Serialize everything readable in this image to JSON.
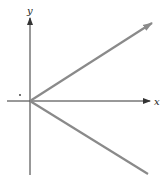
{
  "diagram": {
    "type": "coordinate-axes-with-rays",
    "axes": {
      "x_label": "x",
      "y_label": "y"
    },
    "origin": {
      "px": 30,
      "py": 101
    },
    "rays": [
      {
        "name": "upper-ray",
        "from": [
          30,
          101
        ],
        "to": [
          152,
          23
        ],
        "arrowhead": true
      },
      {
        "name": "lower-ray",
        "from": [
          30,
          101
        ],
        "to": [
          148,
          174
        ],
        "arrowhead": false
      }
    ],
    "marker_dot": {
      "px": 20,
      "py": 95
    },
    "colors": {
      "axis": "#333333",
      "ray": "#8a8a8a",
      "background": "#ffffff"
    }
  }
}
